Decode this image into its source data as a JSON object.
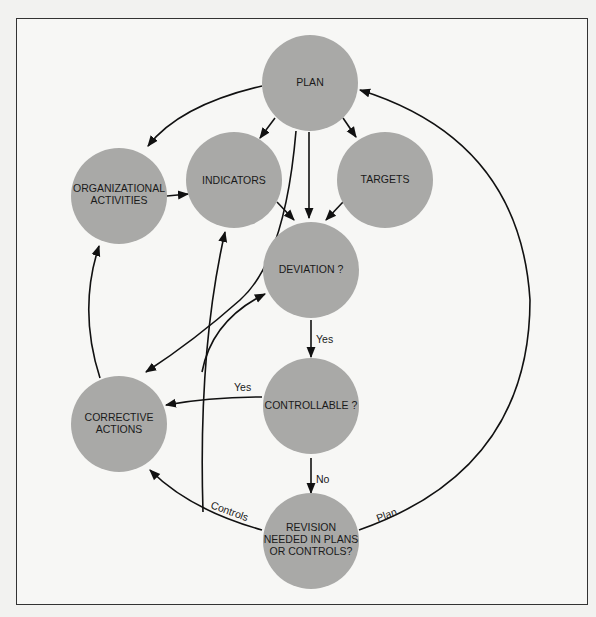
{
  "diagram": {
    "colors": {
      "node_fill": "#a9a9a7",
      "edge": "#111111",
      "background": "#f7f7f5"
    },
    "nodes": {
      "plan": {
        "lines": [
          "PLAN"
        ]
      },
      "org": {
        "lines": [
          "ORGANIZATIONAL",
          "ACTIVITIES"
        ]
      },
      "indicators": {
        "lines": [
          "INDICATORS"
        ]
      },
      "targets": {
        "lines": [
          "TARGETS"
        ]
      },
      "deviation": {
        "lines": [
          "DEVIATION ?"
        ]
      },
      "controllable": {
        "lines": [
          "CONTROLLABLE ?"
        ]
      },
      "corrective": {
        "lines": [
          "CORRECTIVE",
          "ACTIONS"
        ]
      },
      "revision": {
        "lines": [
          "REVISION",
          "NEEDED IN PLANS",
          "OR CONTROLS?"
        ]
      }
    },
    "edge_labels": {
      "deviation_yes": "Yes",
      "controllable_yes": "Yes",
      "controllable_no": "No",
      "controls": "Controls",
      "plan": "Plan"
    }
  }
}
